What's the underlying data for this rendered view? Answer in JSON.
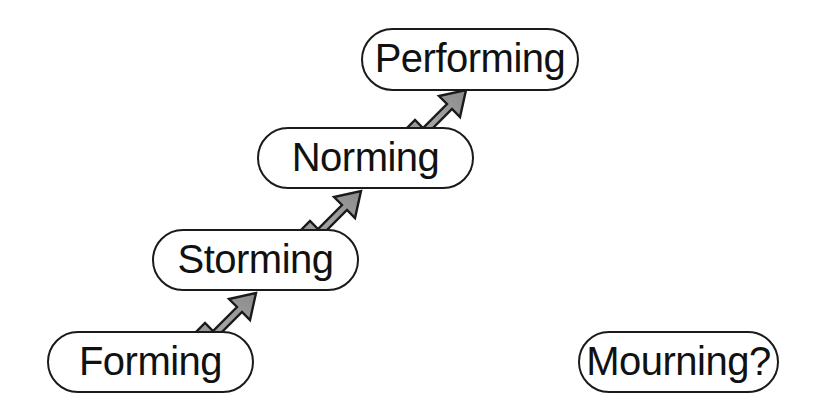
{
  "diagram": {
    "background_color": "#ffffff",
    "box_border_color": "#1a1a1a",
    "box_fill_color": "#ffffff",
    "arrow_fill_color": "#999999",
    "arrow_outline_color": "#1a1a1a",
    "stages": [
      {
        "id": "forming",
        "label": "Forming",
        "order": 1
      },
      {
        "id": "storming",
        "label": "Storming",
        "order": 2
      },
      {
        "id": "norming",
        "label": "Norming",
        "order": 3
      },
      {
        "id": "performing",
        "label": "Performing",
        "order": 4
      },
      {
        "id": "mourning",
        "label": "Mourning?",
        "order": 5
      }
    ],
    "arrows": [
      {
        "id": "forming-to-storming",
        "from": "Forming",
        "to": "Storming",
        "direction": "up-right"
      },
      {
        "id": "storming-to-norming",
        "from": "Storming",
        "to": "Norming",
        "direction": "up-right"
      },
      {
        "id": "norming-to-performing",
        "from": "Norming",
        "to": "Performing",
        "direction": "up-right"
      }
    ]
  }
}
